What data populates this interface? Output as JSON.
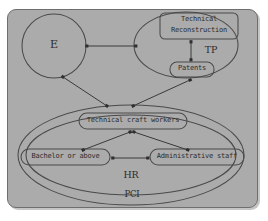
{
  "diagram": {
    "background_color": "#ababab",
    "stroke_color": "#4a4a4a",
    "text_color": "#2b2b2b",
    "nodes": {
      "e_circle": {
        "label": "E"
      },
      "technical_reconstruction": {
        "label_line1": "Technical",
        "label_line2": "Reconstruction"
      },
      "patents": {
        "label": "Patents"
      },
      "technical_craft_workers": {
        "label": "Technical craft workers"
      },
      "bachelor_or_above": {
        "label": "Bachelor or above"
      },
      "administrative_staff": {
        "label": "Administrative staff"
      }
    },
    "groups": {
      "tp": {
        "label": "TP"
      },
      "hr": {
        "label": "HR"
      },
      "pci": {
        "label": "PCI"
      }
    },
    "edges": [
      {
        "from": "e_circle",
        "to": "tp",
        "type": "double-arrow",
        "orientation": "horizontal"
      },
      {
        "from": "technical_reconstruction",
        "to": "patents",
        "type": "double-arrow",
        "orientation": "vertical"
      },
      {
        "from": "e_circle",
        "to": "technical_craft_workers",
        "type": "double-arrow",
        "orientation": "diagonal"
      },
      {
        "from": "patents",
        "to": "technical_craft_workers",
        "type": "double-arrow",
        "orientation": "diagonal"
      },
      {
        "from": "technical_craft_workers",
        "to": "bachelor_or_above",
        "type": "double-arrow",
        "orientation": "diagonal"
      },
      {
        "from": "technical_craft_workers",
        "to": "administrative_staff",
        "type": "double-arrow",
        "orientation": "diagonal"
      },
      {
        "from": "bachelor_or_above",
        "to": "administrative_staff",
        "type": "double-arrow",
        "orientation": "horizontal"
      }
    ]
  }
}
